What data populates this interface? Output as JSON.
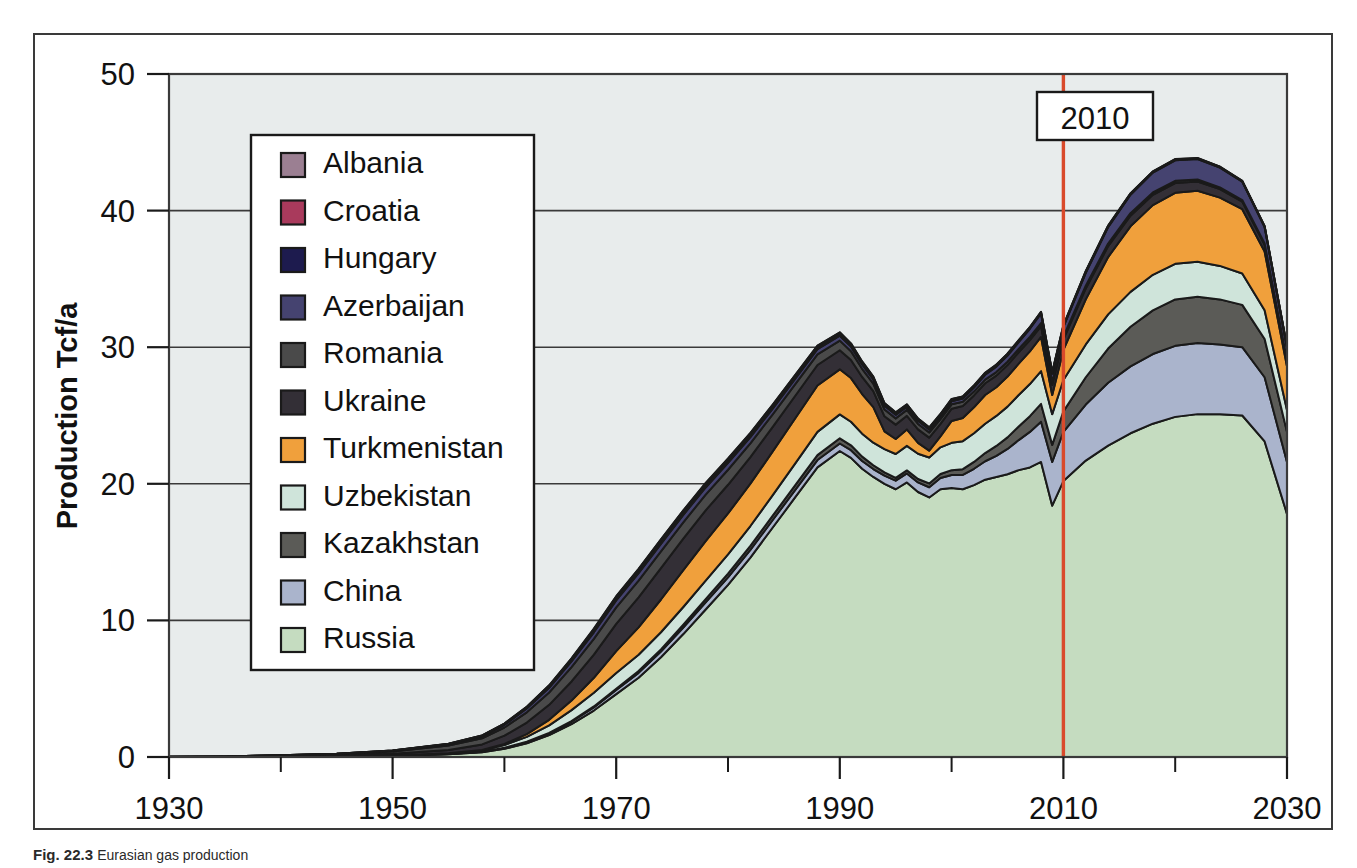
{
  "figure": {
    "caption_label": "Fig. 22.3",
    "caption_text": "Eurasian gas production"
  },
  "annotation": {
    "marker_year_label": "2010",
    "marker_color": "#d94a2b",
    "marker_x": 2010
  },
  "axes": {
    "y_title": "Production Tcf/a",
    "y_ticks": [
      0,
      10,
      20,
      30,
      40,
      50
    ],
    "y_tick_labels": [
      "0",
      "10",
      "20",
      "30",
      "40",
      "50"
    ],
    "y_min": 0,
    "y_max": 50,
    "x_min": 1930,
    "x_max": 2030,
    "x_major_ticks": [
      1930,
      1950,
      1970,
      1990,
      2010,
      2030
    ],
    "x_major_labels": [
      "1930",
      "1950",
      "1970",
      "1990",
      "2010",
      "2030"
    ],
    "x_minor_ticks": [
      1940,
      1960,
      1980,
      2000,
      2020
    ],
    "grid": "horizontal",
    "plot_background": "#e8ecec"
  },
  "legend": {
    "position": "inside-upper-left",
    "items": [
      {
        "label": "Albania",
        "color": "#9b7f92"
      },
      {
        "label": "Croatia",
        "color": "#a93a5c"
      },
      {
        "label": "Hungary",
        "color": "#1d1b4e"
      },
      {
        "label": "Azerbaijan",
        "color": "#454370"
      },
      {
        "label": "Romania",
        "color": "#4a4a4a"
      },
      {
        "label": "Ukraine",
        "color": "#332f36"
      },
      {
        "label": "Turkmenistan",
        "color": "#f0a03c"
      },
      {
        "label": "Uzbekistan",
        "color": "#cfe4da"
      },
      {
        "label": "Kazakhstan",
        "color": "#5b5b57"
      },
      {
        "label": "China",
        "color": "#aab4cc"
      },
      {
        "label": "Russia",
        "color": "#c5dcc0"
      }
    ]
  },
  "chart_data": {
    "type": "area",
    "title": "",
    "subtitle": "",
    "xlabel": "",
    "ylabel": "Production Tcf/a",
    "xlim": [
      1930,
      2030
    ],
    "ylim": [
      0,
      50
    ],
    "stacking": "stacked",
    "stack_order_bottom_to_top": [
      "Russia",
      "China",
      "Kazakhstan",
      "Uzbekistan",
      "Turkmenistan",
      "Ukraine",
      "Romania",
      "Azerbaijan",
      "Hungary",
      "Croatia",
      "Albania"
    ],
    "x": [
      1930,
      1935,
      1940,
      1945,
      1950,
      1955,
      1958,
      1960,
      1962,
      1964,
      1966,
      1968,
      1970,
      1972,
      1974,
      1976,
      1978,
      1980,
      1982,
      1984,
      1986,
      1988,
      1990,
      1991,
      1992,
      1993,
      1994,
      1995,
      1996,
      1997,
      1998,
      1999,
      2000,
      2001,
      2002,
      2003,
      2004,
      2005,
      2006,
      2007,
      2008,
      2009,
      2010,
      2012,
      2014,
      2016,
      2018,
      2020,
      2022,
      2024,
      2026,
      2028,
      2030
    ],
    "series": [
      {
        "name": "Russia",
        "values": [
          0.0,
          0.0,
          0.02,
          0.05,
          0.1,
          0.2,
          0.35,
          0.6,
          1.0,
          1.6,
          2.4,
          3.4,
          4.6,
          5.8,
          7.3,
          9.0,
          10.8,
          12.6,
          14.6,
          16.8,
          19.0,
          21.2,
          22.4,
          21.9,
          21.1,
          20.5,
          20.0,
          19.6,
          20.1,
          19.4,
          19.0,
          19.6,
          19.7,
          19.6,
          19.9,
          20.3,
          20.5,
          20.7,
          21.0,
          21.2,
          21.6,
          18.4,
          20.2,
          21.7,
          22.8,
          23.7,
          24.4,
          24.9,
          25.1,
          25.1,
          25.0,
          23.1,
          17.8
        ]
      },
      {
        "name": "China",
        "values": [
          0.0,
          0.0,
          0.0,
          0.0,
          0.0,
          0.02,
          0.04,
          0.07,
          0.1,
          0.14,
          0.18,
          0.23,
          0.3,
          0.36,
          0.42,
          0.48,
          0.52,
          0.55,
          0.56,
          0.55,
          0.54,
          0.54,
          0.55,
          0.56,
          0.57,
          0.58,
          0.6,
          0.63,
          0.66,
          0.7,
          0.75,
          0.82,
          0.95,
          1.05,
          1.2,
          1.35,
          1.55,
          1.85,
          2.2,
          2.6,
          2.95,
          3.2,
          3.6,
          4.1,
          4.6,
          4.9,
          5.1,
          5.2,
          5.2,
          5.1,
          5.0,
          4.7,
          3.8
        ]
      },
      {
        "name": "Kazakhstan",
        "values": [
          0.0,
          0.0,
          0.0,
          0.0,
          0.0,
          0.0,
          0.0,
          0.01,
          0.02,
          0.03,
          0.05,
          0.07,
          0.1,
          0.13,
          0.16,
          0.2,
          0.24,
          0.28,
          0.3,
          0.32,
          0.34,
          0.36,
          0.38,
          0.36,
          0.32,
          0.28,
          0.24,
          0.2,
          0.22,
          0.25,
          0.28,
          0.3,
          0.35,
          0.42,
          0.5,
          0.6,
          0.72,
          0.85,
          1.0,
          1.15,
          1.3,
          1.25,
          1.5,
          2.0,
          2.5,
          2.9,
          3.2,
          3.4,
          3.4,
          3.3,
          3.1,
          2.8,
          2.2
        ]
      },
      {
        "name": "Uzbekistan",
        "values": [
          0.0,
          0.0,
          0.0,
          0.0,
          0.01,
          0.04,
          0.1,
          0.2,
          0.35,
          0.55,
          0.8,
          1.0,
          1.15,
          1.2,
          1.25,
          1.3,
          1.35,
          1.4,
          1.45,
          1.5,
          1.6,
          1.7,
          1.75,
          1.72,
          1.68,
          1.65,
          1.7,
          1.75,
          1.8,
          1.85,
          1.9,
          1.95,
          2.0,
          2.05,
          2.1,
          2.15,
          2.2,
          2.25,
          2.3,
          2.35,
          2.4,
          2.25,
          2.3,
          2.4,
          2.5,
          2.55,
          2.6,
          2.6,
          2.55,
          2.45,
          2.3,
          2.1,
          1.6
        ]
      },
      {
        "name": "Turkmenistan",
        "values": [
          0.0,
          0.0,
          0.0,
          0.0,
          0.0,
          0.01,
          0.03,
          0.08,
          0.2,
          0.4,
          0.7,
          1.1,
          1.6,
          2.0,
          2.4,
          2.7,
          2.9,
          3.0,
          3.1,
          3.2,
          3.3,
          3.4,
          3.3,
          3.2,
          2.9,
          2.6,
          1.3,
          1.1,
          1.2,
          0.8,
          0.5,
          0.8,
          1.6,
          1.7,
          1.9,
          2.1,
          2.1,
          2.2,
          2.3,
          2.4,
          2.5,
          1.4,
          2.2,
          3.3,
          4.2,
          4.8,
          5.1,
          5.2,
          5.2,
          5.0,
          4.7,
          4.3,
          3.2
        ]
      },
      {
        "name": "Ukraine",
        "values": [
          0.0,
          0.0,
          0.03,
          0.06,
          0.12,
          0.25,
          0.4,
          0.6,
          0.85,
          1.1,
          1.4,
          1.7,
          2.0,
          2.2,
          2.3,
          2.3,
          2.25,
          2.1,
          1.95,
          1.8,
          1.65,
          1.5,
          1.4,
          1.32,
          1.25,
          1.18,
          1.1,
          1.05,
          1.0,
          0.98,
          0.95,
          0.92,
          0.9,
          0.88,
          0.87,
          0.86,
          0.85,
          0.84,
          0.83,
          0.82,
          0.8,
          0.74,
          0.78,
          0.8,
          0.8,
          0.78,
          0.76,
          0.72,
          0.68,
          0.62,
          0.56,
          0.5,
          0.38
        ]
      },
      {
        "name": "Romania",
        "values": [
          0.02,
          0.04,
          0.07,
          0.1,
          0.18,
          0.32,
          0.45,
          0.6,
          0.75,
          0.9,
          1.05,
          1.15,
          1.2,
          1.22,
          1.22,
          1.2,
          1.15,
          1.1,
          1.0,
          0.92,
          0.85,
          0.78,
          0.7,
          0.65,
          0.6,
          0.55,
          0.5,
          0.46,
          0.43,
          0.4,
          0.37,
          0.34,
          0.32,
          0.3,
          0.28,
          0.27,
          0.26,
          0.25,
          0.24,
          0.23,
          0.22,
          0.2,
          0.2,
          0.2,
          0.19,
          0.18,
          0.17,
          0.16,
          0.15,
          0.13,
          0.11,
          0.1,
          0.07
        ]
      },
      {
        "name": "Azerbaijan",
        "values": [
          0.0,
          0.0,
          0.01,
          0.02,
          0.05,
          0.1,
          0.15,
          0.2,
          0.28,
          0.35,
          0.42,
          0.48,
          0.52,
          0.55,
          0.56,
          0.55,
          0.52,
          0.5,
          0.46,
          0.42,
          0.4,
          0.38,
          0.36,
          0.34,
          0.32,
          0.3,
          0.28,
          0.26,
          0.24,
          0.23,
          0.22,
          0.22,
          0.23,
          0.25,
          0.3,
          0.35,
          0.4,
          0.45,
          0.5,
          0.6,
          0.7,
          0.62,
          0.7,
          0.95,
          1.2,
          1.35,
          1.45,
          1.5,
          1.5,
          1.45,
          1.35,
          1.2,
          0.95
        ]
      },
      {
        "name": "Hungary",
        "values": [
          0.0,
          0.0,
          0.0,
          0.0,
          0.01,
          0.02,
          0.04,
          0.06,
          0.09,
          0.12,
          0.15,
          0.18,
          0.2,
          0.21,
          0.22,
          0.22,
          0.22,
          0.21,
          0.2,
          0.19,
          0.18,
          0.17,
          0.16,
          0.15,
          0.14,
          0.13,
          0.12,
          0.12,
          0.11,
          0.11,
          0.1,
          0.1,
          0.1,
          0.09,
          0.09,
          0.09,
          0.08,
          0.08,
          0.08,
          0.07,
          0.07,
          0.06,
          0.07,
          0.07,
          0.06,
          0.06,
          0.05,
          0.05,
          0.04,
          0.04,
          0.03,
          0.03,
          0.02
        ]
      },
      {
        "name": "Croatia",
        "values": [
          0.0,
          0.0,
          0.0,
          0.0,
          0.0,
          0.01,
          0.01,
          0.02,
          0.03,
          0.04,
          0.05,
          0.06,
          0.07,
          0.08,
          0.08,
          0.08,
          0.08,
          0.08,
          0.08,
          0.08,
          0.07,
          0.07,
          0.07,
          0.06,
          0.06,
          0.06,
          0.05,
          0.05,
          0.05,
          0.05,
          0.05,
          0.05,
          0.05,
          0.05,
          0.05,
          0.05,
          0.05,
          0.05,
          0.05,
          0.04,
          0.04,
          0.04,
          0.04,
          0.04,
          0.04,
          0.03,
          0.03,
          0.03,
          0.02,
          0.02,
          0.02,
          0.02,
          0.01
        ]
      },
      {
        "name": "Albania",
        "values": [
          0.0,
          0.0,
          0.0,
          0.0,
          0.0,
          0.0,
          0.01,
          0.01,
          0.01,
          0.02,
          0.02,
          0.03,
          0.03,
          0.03,
          0.03,
          0.03,
          0.03,
          0.03,
          0.03,
          0.02,
          0.02,
          0.02,
          0.02,
          0.02,
          0.02,
          0.02,
          0.02,
          0.02,
          0.01,
          0.01,
          0.01,
          0.01,
          0.01,
          0.01,
          0.01,
          0.01,
          0.01,
          0.01,
          0.01,
          0.01,
          0.01,
          0.01,
          0.01,
          0.01,
          0.01,
          0.01,
          0.01,
          0.01,
          0.01,
          0.01,
          0.01,
          0.01,
          0.0
        ]
      }
    ]
  }
}
